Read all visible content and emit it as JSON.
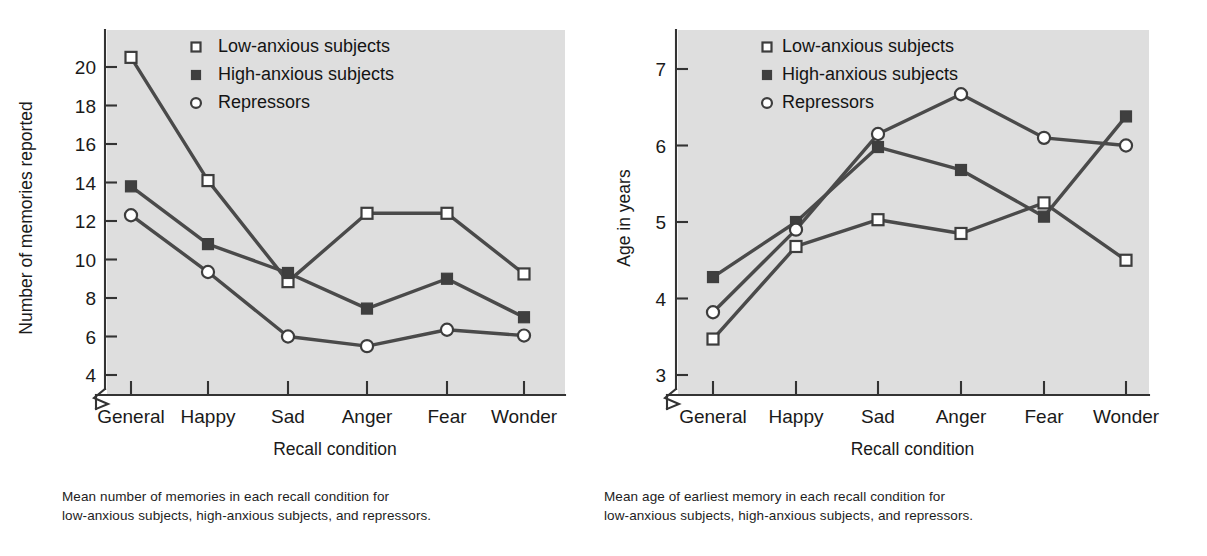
{
  "figure": {
    "background_color": "#ffffff",
    "plot_background_color": "#dedede",
    "line_color": "#4a4a4a",
    "axis_color": "#333333"
  },
  "legend": {
    "position": "top-left-inside",
    "entries": [
      {
        "label": "Low-anxious subjects",
        "marker": "open-square-marker"
      },
      {
        "label": "High-anxious subjects",
        "marker": "filled-square-marker"
      },
      {
        "label": "Repressors",
        "marker": "open-circle-marker"
      }
    ]
  },
  "chart_data": [
    {
      "id": "memories-chart",
      "type": "line",
      "title": "",
      "xlabel": "Recall condition",
      "ylabel": "Number of memories reported",
      "categories": [
        "General",
        "Happy",
        "Sad",
        "Anger",
        "Fear",
        "Wonder"
      ],
      "yticks": [
        4,
        6,
        8,
        10,
        12,
        14,
        16,
        18,
        20
      ],
      "ylim": [
        3.2,
        21.4
      ],
      "axis_break": true,
      "grid": false,
      "legend_position": "top-left-inside",
      "series": [
        {
          "name": "Low-anxious subjects",
          "marker": "open-square-marker",
          "values": [
            20.5,
            14.1,
            8.85,
            12.4,
            12.4,
            9.25
          ]
        },
        {
          "name": "High-anxious subjects",
          "marker": "filled-square-marker",
          "values": [
            13.8,
            10.8,
            9.3,
            7.45,
            9.0,
            7.0
          ]
        },
        {
          "name": "Repressors",
          "marker": "open-circle-marker",
          "values": [
            12.3,
            9.35,
            6.0,
            5.5,
            6.35,
            6.05
          ]
        }
      ],
      "caption_lines": [
        "Mean number of memories in each recall condition for",
        "low-anxious subjects, high-anxious subjects, and repressors."
      ]
    },
    {
      "id": "age-chart",
      "type": "line",
      "title": "",
      "xlabel": "Recall condition",
      "ylabel": "Age in years",
      "categories": [
        "General",
        "Happy",
        "Sad",
        "Anger",
        "Fear",
        "Wonder"
      ],
      "yticks": [
        3,
        4,
        5,
        6,
        7
      ],
      "ylim": [
        2.6,
        7.45
      ],
      "axis_break": true,
      "grid": false,
      "legend_position": "top-left-inside",
      "series": [
        {
          "name": "Low-anxious subjects",
          "marker": "open-square-marker",
          "values": [
            3.47,
            4.68,
            5.03,
            4.85,
            5.25,
            4.5
          ]
        },
        {
          "name": "High-anxious subjects",
          "marker": "filled-square-marker",
          "values": [
            4.28,
            5.0,
            5.98,
            5.68,
            5.07,
            6.38
          ]
        },
        {
          "name": "Repressors",
          "marker": "open-circle-marker",
          "values": [
            3.82,
            4.9,
            6.15,
            6.67,
            6.1,
            6.0
          ]
        }
      ],
      "caption_lines": [
        "Mean age of earliest memory in each recall condition for",
        "low-anxious subjects, high-anxious subjects, and repressors."
      ]
    }
  ]
}
